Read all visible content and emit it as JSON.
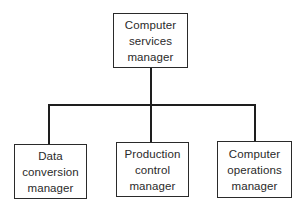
{
  "diagram": {
    "type": "org-chart",
    "root": {
      "label": "Computer\nservices\nmanager"
    },
    "children": [
      {
        "label": "Data\nconversion\nmanager"
      },
      {
        "label": "Production\ncontrol\nmanager"
      },
      {
        "label": "Computer\noperations\nmanager"
      }
    ],
    "colors": {
      "line": "#1e1e1e",
      "border": "#2a2a2a",
      "text": "#2a2a2a",
      "background": "#ffffff"
    }
  }
}
